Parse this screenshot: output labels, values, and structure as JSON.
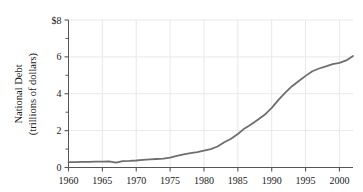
{
  "chart_data": {
    "type": "line",
    "title": "",
    "subtitle": "",
    "xlabel": "",
    "ylabel": "National Debt\n(trillions of dollars)",
    "ylabel_line1": "National Debt",
    "ylabel_line2": "(trillions of dollars)",
    "xlim": [
      1960,
      2002
    ],
    "ylim": [
      0,
      8
    ],
    "xticks": [
      1960,
      1965,
      1970,
      1975,
      1980,
      1985,
      1990,
      1995,
      2000
    ],
    "xtick_labels": [
      "1960",
      "1965",
      "1970",
      "1975",
      "1980",
      "1985",
      "1990",
      "1995",
      "2000"
    ],
    "yticks": [
      0,
      2,
      4,
      6,
      8
    ],
    "ytick_labels": [
      "0",
      "2",
      "4",
      "6",
      "$8"
    ],
    "y_minor_ticks": [
      1,
      3,
      5,
      7
    ],
    "grid": true,
    "grid_color": "#e8e8e8",
    "legend": null,
    "line_color": "#6e6e6e",
    "line_width": 1.8,
    "series": [
      {
        "name": "National Debt",
        "x": [
          1960,
          1961,
          1962,
          1963,
          1964,
          1965,
          1966,
          1967,
          1968,
          1969,
          1970,
          1971,
          1972,
          1973,
          1974,
          1975,
          1976,
          1977,
          1978,
          1979,
          1980,
          1981,
          1982,
          1983,
          1984,
          1985,
          1986,
          1987,
          1988,
          1989,
          1990,
          1991,
          1992,
          1993,
          1994,
          1995,
          1996,
          1997,
          1998,
          1999,
          2000,
          2001,
          2002
        ],
        "values": [
          0.29,
          0.29,
          0.3,
          0.31,
          0.32,
          0.32,
          0.33,
          0.27,
          0.35,
          0.36,
          0.38,
          0.41,
          0.44,
          0.46,
          0.48,
          0.54,
          0.63,
          0.71,
          0.78,
          0.83,
          0.91,
          1.0,
          1.14,
          1.37,
          1.56,
          1.82,
          2.12,
          2.35,
          2.6,
          2.87,
          3.23,
          3.67,
          4.06,
          4.41,
          4.69,
          4.97,
          5.22,
          5.37,
          5.48,
          5.61,
          5.67,
          5.81,
          6.05
        ]
      }
    ]
  },
  "axes": {
    "y_title_line1": "National Debt",
    "y_title_line2": "(trillions of dollars)"
  }
}
